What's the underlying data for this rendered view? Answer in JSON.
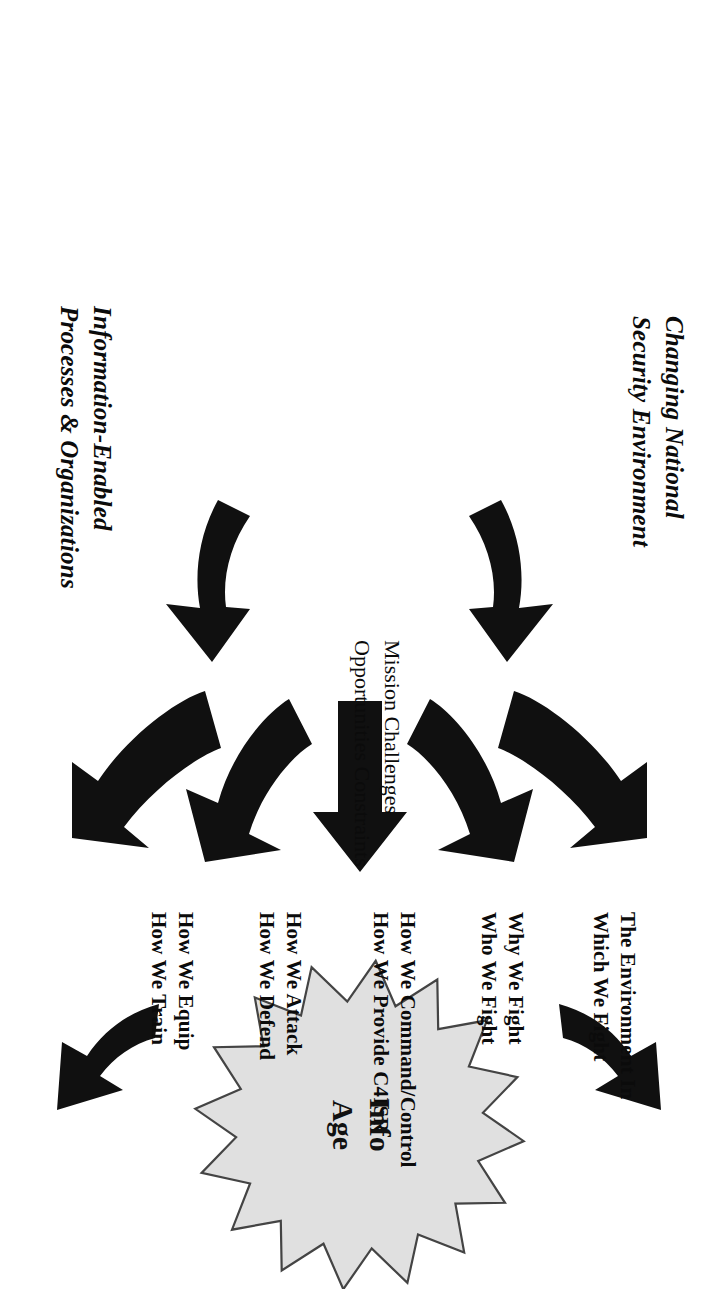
{
  "diagram": {
    "center_node": {
      "name": "info-age-starburst",
      "line1": "Info",
      "line2": "Age",
      "shape": "16-point-starburst",
      "fill": "#e0e0e0",
      "stroke": "#444444"
    },
    "drivers": [
      {
        "id": "changing-national-security-environment",
        "line1": "Changing National",
        "line2": "Security Environment",
        "style": "bold-italic"
      },
      {
        "id": "information-enabled-processes-organizations",
        "line1": "Information-Enabled",
        "line2": "Processes & Organizations",
        "style": "bold-italic"
      }
    ],
    "middle": {
      "line1": "Mission Challenges",
      "line2": "Opportunities Constraints"
    },
    "outcomes": [
      {
        "id": "environment",
        "line1": "The Environment In",
        "line2": "Which We Fight"
      },
      {
        "id": "why-who",
        "line1": "Why We Fight",
        "line2": "Who We Fight"
      },
      {
        "id": "command-c4isr",
        "line1": "How We Command/Control",
        "line2": "How We Provide C4ISR"
      },
      {
        "id": "attack-defend",
        "line1": "How We Attack",
        "line2": "How We Defend"
      },
      {
        "id": "equip-train",
        "line1": "How We Equip",
        "line2": "How We Train"
      }
    ],
    "arrows": {
      "fan_count": 5,
      "curved_count": 4,
      "color": "#101010"
    }
  }
}
